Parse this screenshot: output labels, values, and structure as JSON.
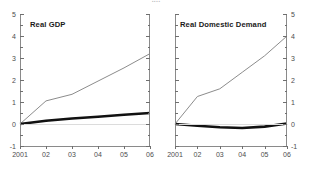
{
  "figure": {
    "title_visible_fragment": "...."
  },
  "panels": [
    {
      "key": "left",
      "title": "Real GDP"
    },
    {
      "key": "right",
      "title": "Real Domestic Demand"
    }
  ],
  "axis": {
    "y_major_labels": [
      "5",
      "4",
      "3",
      "2",
      "1",
      "0",
      "-1"
    ],
    "y_major_values": [
      5,
      4,
      3,
      2,
      1,
      0,
      -1
    ],
    "y_minor_values": [
      4.5,
      3.5,
      2.5,
      1.5,
      0.5,
      -0.5
    ],
    "x_labels": [
      "2001",
      "02",
      "03",
      "04",
      "05",
      "06"
    ],
    "x_values": [
      2001,
      2002,
      2003,
      2004,
      2005,
      2006
    ],
    "ylim": [
      -1,
      5
    ],
    "xlim": [
      2001,
      2006
    ]
  },
  "colors": {
    "series_thin": "#8c8c8c",
    "series_thick": "#111111",
    "axis": "#8a8a8a",
    "tick": "#6f6f6f",
    "label": "#4d4d4d",
    "zeroline": "#dcdcdc",
    "background": "#ffffff"
  },
  "chart_data": {
    "type": "line",
    "xlabel": "",
    "ylabel": "",
    "xlim": [
      2001,
      2006
    ],
    "ylim": [
      -1,
      5
    ],
    "grid": false,
    "legend": "none",
    "x": [
      2001,
      2002,
      2003,
      2004,
      2005,
      2006
    ],
    "panels": [
      {
        "name": "Real GDP",
        "series": [
          {
            "name": "cumulative-thin-line",
            "style": "thin-grey",
            "values": [
              0.0,
              1.05,
              1.35,
              1.95,
              2.55,
              3.2
            ]
          },
          {
            "name": "cumulative-thick-line",
            "style": "thick-black",
            "values": [
              0.0,
              0.15,
              0.25,
              0.33,
              0.42,
              0.5
            ]
          }
        ]
      },
      {
        "name": "Real Domestic Demand",
        "series": [
          {
            "name": "cumulative-thin-line",
            "style": "thin-grey",
            "values": [
              0.0,
              1.25,
              1.6,
              2.35,
              3.1,
              4.0
            ]
          },
          {
            "name": "cumulative-thick-line",
            "style": "thick-black",
            "values": [
              0.0,
              -0.08,
              -0.15,
              -0.18,
              -0.12,
              0.02
            ]
          }
        ]
      }
    ]
  }
}
